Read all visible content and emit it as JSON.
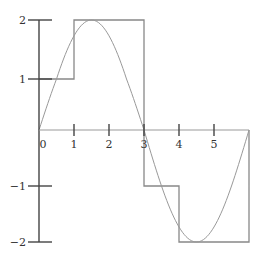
{
  "chart_data": {
    "type": "line",
    "title": "",
    "xlabel": "",
    "ylabel": "",
    "xlim": [
      0,
      6
    ],
    "ylim": [
      -2,
      2
    ],
    "x_ticks": [
      "0",
      "1",
      "2",
      "3",
      "4",
      "5"
    ],
    "y_ticks": [
      "2",
      "1",
      "−1",
      "−2"
    ],
    "grid": false,
    "legend": null,
    "series": [
      {
        "name": "sine curve",
        "function": "2*sin(pi*x/3)",
        "x_range": [
          0,
          6
        ],
        "color": "#999999"
      },
      {
        "name": "step function",
        "points": [
          [
            0,
            1
          ],
          [
            1,
            1
          ],
          [
            1,
            2
          ],
          [
            3,
            2
          ],
          [
            3,
            -1
          ],
          [
            4,
            -1
          ],
          [
            4,
            -2
          ],
          [
            6,
            -2
          ],
          [
            6,
            0
          ]
        ],
        "color": "#888888"
      }
    ]
  },
  "colors": {
    "axis": "#444444",
    "curve": "#999999",
    "steps": "#888888"
  }
}
